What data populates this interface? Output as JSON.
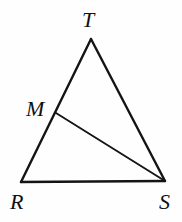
{
  "figure": {
    "kind": "geometry-diagram",
    "background_color": "#fefefe",
    "stroke_color": "#141414",
    "label_color": "#101010",
    "canvas": {
      "width": 182,
      "height": 222
    },
    "points": {
      "T": {
        "label": "T",
        "x": 91,
        "y": 39,
        "label_x": 82,
        "label_y": 27
      },
      "M": {
        "label": "M",
        "x": 56,
        "y": 113,
        "label_x": 26,
        "label_y": 116
      },
      "R": {
        "label": "R",
        "x": 21,
        "y": 182,
        "label_x": 10,
        "label_y": 209
      },
      "S": {
        "label": "S",
        "x": 165,
        "y": 181,
        "label_x": 159,
        "label_y": 209
      }
    },
    "segments": [
      {
        "name": "side-RT",
        "from": "R",
        "to": "T",
        "weight": "thick"
      },
      {
        "name": "side-TS",
        "from": "T",
        "to": "S",
        "weight": "thick"
      },
      {
        "name": "side-RS",
        "from": "R",
        "to": "S",
        "weight": "thick"
      },
      {
        "name": "cevian-MS",
        "from": "M",
        "to": "S",
        "weight": "thin"
      }
    ]
  }
}
